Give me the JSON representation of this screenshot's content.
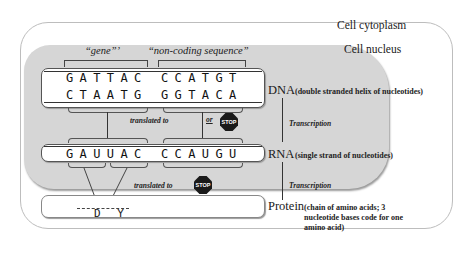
{
  "regions": {
    "cytoplasm_label": "Cell cytoplasm",
    "nucleus_label": "Cell nucleus"
  },
  "headers": {
    "gene": "“gene”ʼ",
    "noncoding": "“non-coding sequence”"
  },
  "dna": {
    "label": "DNA",
    "description": "(double stranded helix of nucleotides)",
    "top_strand": [
      "GATTAC",
      "CCATGT"
    ],
    "bottom_strand": [
      "CTAATG",
      "GGTACA"
    ]
  },
  "rna": {
    "label": "RNA",
    "description": "(single strand of nucleotides)",
    "strand": [
      "GAUUAC",
      "CCAUGU"
    ]
  },
  "protein": {
    "label": "Protein",
    "description_lines": [
      "(chain of amino acids; 3",
      "nucleotide bases code for one",
      "amino acid)"
    ],
    "sequence": "D Y"
  },
  "arrows": {
    "transcription_1": "Transcription",
    "transcription_2": "Transcription",
    "translated_to_1": "translated to",
    "translated_to_2": "translated to",
    "or_label": "or"
  },
  "icons": {
    "stop_1": "STOP",
    "stop_2": "STOP"
  }
}
